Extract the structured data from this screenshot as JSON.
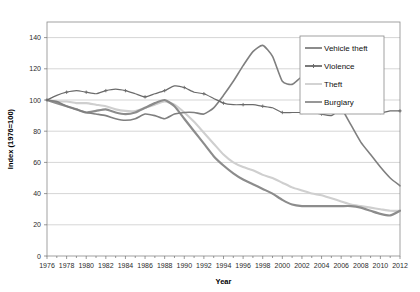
{
  "chart_data": {
    "type": "line",
    "title": "",
    "xlabel": "Year",
    "ylabel": "Index (1976=100)",
    "xlim": [
      1976,
      2012
    ],
    "ylim": [
      0,
      150
    ],
    "ytick_values": [
      0,
      20,
      40,
      60,
      80,
      100,
      120,
      140
    ],
    "ytick_labels": [
      "0",
      "20",
      "40",
      "60",
      "80",
      "100",
      "120",
      "140"
    ],
    "xtick_values": [
      1976,
      1978,
      1980,
      1982,
      1984,
      1986,
      1988,
      1990,
      1992,
      1994,
      1996,
      1998,
      2000,
      2002,
      2004,
      2006,
      2008,
      2010,
      2012
    ],
    "xtick_labels": [
      "1976",
      "1978",
      "1980",
      "1982",
      "1984",
      "1986",
      "1988",
      "1990",
      "1992",
      "1994",
      "1996",
      "1998",
      "2000",
      "2002",
      "2004",
      "2006",
      "2008",
      "2010",
      "2012"
    ],
    "grid": "horizontal",
    "legend_position": "top-right",
    "x": [
      1976,
      1977,
      1978,
      1979,
      1980,
      1981,
      1982,
      1983,
      1984,
      1985,
      1986,
      1987,
      1988,
      1989,
      1990,
      1991,
      1992,
      1993,
      1994,
      1995,
      1996,
      1997,
      1998,
      1999,
      2000,
      2001,
      2002,
      2003,
      2004,
      2005,
      2006,
      2007,
      2008,
      2009,
      2010,
      2011,
      2012
    ],
    "series": [
      {
        "name": "Vehicle theft",
        "color": "#7f7f7f",
        "width": 1.6,
        "marker": "none",
        "values": [
          100,
          99,
          96,
          94,
          92,
          91,
          90,
          88,
          87,
          88,
          91,
          90,
          88,
          91,
          92,
          92,
          91,
          95,
          103,
          112,
          122,
          131,
          135,
          128,
          112,
          110,
          115,
          116,
          112,
          103,
          95,
          84,
          73,
          65,
          57,
          50,
          45
        ]
      },
      {
        "name": "Violence",
        "color": "#6b6b6b",
        "width": 1.2,
        "marker": "plus",
        "values": [
          100,
          103,
          105,
          106,
          105,
          104,
          106,
          107,
          106,
          104,
          102,
          104,
          106,
          109,
          108,
          105,
          104,
          101,
          98,
          97,
          97,
          97,
          96,
          95,
          92,
          92,
          92,
          92,
          91,
          90,
          95,
          102,
          101,
          97,
          92,
          93,
          93
        ]
      },
      {
        "name": "Theft",
        "color": "#cfcfcf",
        "width": 2.1,
        "marker": "none",
        "values": [
          100,
          99,
          99,
          98,
          98,
          97,
          96,
          94,
          93,
          93,
          95,
          97,
          99,
          97,
          92,
          86,
          79,
          72,
          65,
          60,
          57,
          55,
          52,
          50,
          47,
          44,
          42,
          40,
          39,
          37,
          35,
          33,
          32,
          31,
          30,
          29,
          29
        ]
      },
      {
        "name": "Burglary",
        "color": "#8c8c8c",
        "width": 2.2,
        "marker": "none",
        "values": [
          100,
          98,
          96,
          94,
          92,
          93,
          94,
          92,
          91,
          92,
          95,
          98,
          100,
          96,
          88,
          80,
          72,
          64,
          58,
          53,
          49,
          46,
          43,
          40,
          36,
          33,
          32,
          32,
          32,
          32,
          32,
          32,
          31,
          29,
          27,
          26,
          29
        ]
      }
    ],
    "legend_entries": [
      {
        "label": "Vehicle theft",
        "color": "#7f7f7f",
        "marker": "none"
      },
      {
        "label": "Violence",
        "color": "#6b6b6b",
        "marker": "plus"
      },
      {
        "label": "Theft",
        "color": "#cfcfcf",
        "marker": "none"
      },
      {
        "label": "Burglary",
        "color": "#8c8c8c",
        "marker": "none"
      }
    ]
  }
}
